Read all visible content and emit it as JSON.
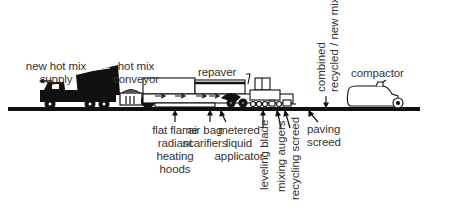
{
  "diagram": {
    "labels": {
      "new_hot_mix_supply": [
        "new hot mix",
        "supply"
      ],
      "hot_mix_conveyor": [
        "hot mix",
        "conveyor"
      ],
      "repaver": "repaver",
      "combined_mix": [
        "combined",
        "recycled / new mix"
      ],
      "compactor": "compactor",
      "flat_flame": [
        "flat flame",
        "radiant",
        "heating",
        "hoods"
      ],
      "air_bag_scarifiers": [
        "air bag",
        "scarifiers"
      ],
      "metered_liquid_applicator": [
        "metered",
        "liquid",
        "applicator"
      ],
      "leveling_blade": "leveling blade",
      "mixing_augers": "mixing augers",
      "recycling_screed": "recycling screed",
      "paving_screed": [
        "paving",
        "screed"
      ]
    },
    "components": [
      "dump-truck",
      "hot-mix-conveyor",
      "repaver",
      "compactor",
      "road-surface"
    ],
    "colors": {
      "ink": "#111111",
      "text": "#333333",
      "background": "#ffffff"
    }
  }
}
